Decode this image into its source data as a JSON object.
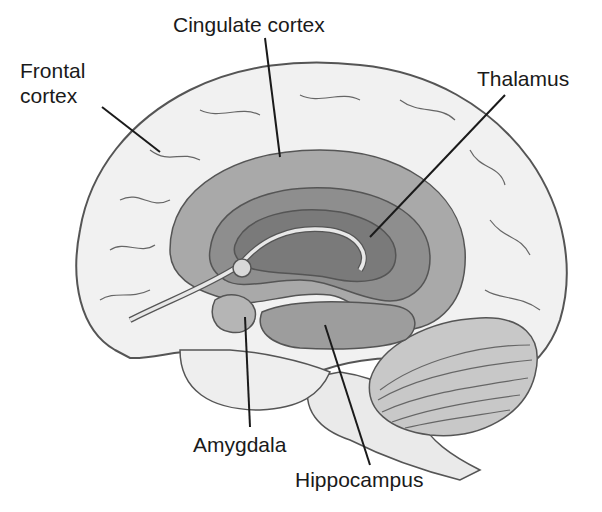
{
  "diagram": {
    "labels": {
      "frontal_line1": "Frontal",
      "frontal_line2": "cortex",
      "cingulate": "Cingulate cortex",
      "thalamus": "Thalamus",
      "amygdala": "Amygdala",
      "hippocampus": "Hippocampus"
    },
    "colors": {
      "outline": "#555555",
      "cortex_fill": "#f1f1f1",
      "cingulate_fill": "#a9a9a9",
      "inner_fill": "#8e8e8e",
      "thalamus_fill": "#7a7a7a",
      "hippocampus_fill": "#9d9d9d",
      "cerebellum_fill": "#c8c8c8",
      "leader": "#1a1a1a"
    }
  }
}
